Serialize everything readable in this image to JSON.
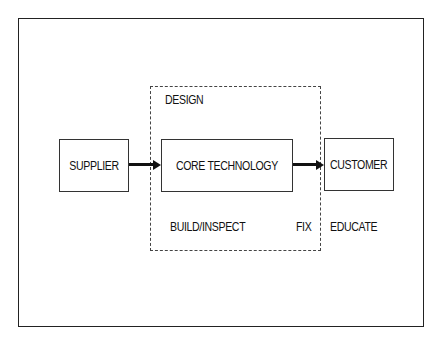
{
  "diagram": {
    "region_label": "DESIGN",
    "nodes": [
      {
        "id": "supplier",
        "label": "SUPPLIER"
      },
      {
        "id": "core",
        "label": "CORE TECHNOLOGY"
      },
      {
        "id": "customer",
        "label": "CUSTOMER"
      }
    ],
    "edges": [
      {
        "from": "supplier",
        "to": "core"
      },
      {
        "from": "core",
        "to": "customer"
      }
    ],
    "annotations": {
      "build_inspect": "BUILD/INSPECT",
      "fix": "FIX",
      "educate": "EDUCATE"
    }
  }
}
